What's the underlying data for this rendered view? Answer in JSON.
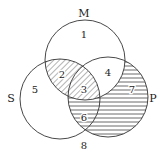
{
  "diagram": {
    "type": "venn-3",
    "sets": [
      {
        "id": "M",
        "label": "M",
        "cx": 85,
        "cy": 60,
        "r": 40,
        "label_x": 84,
        "label_y": 17
      },
      {
        "id": "S",
        "label": "S",
        "cx": 60,
        "cy": 99,
        "r": 40,
        "label_x": 11,
        "label_y": 102
      },
      {
        "id": "P",
        "label": "P",
        "cx": 108,
        "cy": 97,
        "r": 40,
        "label_x": 153,
        "label_y": 102
      }
    ],
    "regions": [
      {
        "n": "1",
        "desc": "M only",
        "x": 84,
        "y": 38,
        "shading": "none"
      },
      {
        "n": "2",
        "desc": "M and S only",
        "x": 62,
        "y": 78,
        "shading": "diagonal"
      },
      {
        "n": "3",
        "desc": "M, S and P",
        "x": 84,
        "y": 93,
        "shading": "diagonal"
      },
      {
        "n": "4",
        "desc": "M and P only",
        "x": 108,
        "y": 76,
        "shading": "none"
      },
      {
        "n": "5",
        "desc": "S only",
        "x": 35,
        "y": 93,
        "shading": "none"
      },
      {
        "n": "6",
        "desc": "S and P only",
        "x": 84,
        "y": 121,
        "shading": "horizontal"
      },
      {
        "n": "7",
        "desc": "P only",
        "x": 132,
        "y": 93,
        "shading": "horizontal"
      },
      {
        "n": "8",
        "desc": "outside all",
        "x": 84,
        "y": 149,
        "shading": "none"
      }
    ],
    "colors": {
      "stroke": "#333333",
      "hatch": "#444444",
      "text": "#222222"
    }
  }
}
